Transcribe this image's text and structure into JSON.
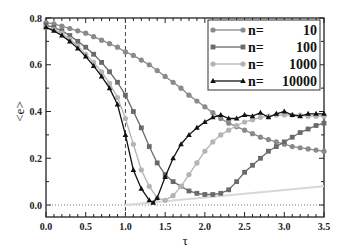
{
  "chart_data": {
    "type": "line",
    "title": "",
    "xlabel": "τ",
    "ylabel": "<e>",
    "xlim": [
      0.0,
      3.5
    ],
    "ylim": [
      0.0,
      0.8
    ],
    "xticks": [
      "0.0",
      "0.5",
      "1.0",
      "1.5",
      "2.0",
      "2.5",
      "3.0",
      "3.5"
    ],
    "yticks": [
      "0.0",
      "0.2",
      "0.4",
      "0.6",
      "0.8"
    ],
    "legend_position": "upper right",
    "annotations": [
      {
        "type": "vertical-dashed-line",
        "x": 1.0
      },
      {
        "type": "horizontal-dotted-line",
        "y": 0.0
      },
      {
        "type": "light-line",
        "x": [
          1.0,
          3.5
        ],
        "y": [
          0.0,
          0.08
        ]
      }
    ],
    "series": [
      {
        "name": "n=    10",
        "marker": "circle",
        "color": "#8a8a8a",
        "x": [
          0,
          0.1,
          0.2,
          0.3,
          0.4,
          0.5,
          0.6,
          0.7,
          0.8,
          0.9,
          1.0,
          1.1,
          1.2,
          1.3,
          1.4,
          1.5,
          1.6,
          1.7,
          1.8,
          1.9,
          2.0,
          2.1,
          2.2,
          2.3,
          2.4,
          2.5,
          2.6,
          2.7,
          2.8,
          2.9,
          3.0,
          3.1,
          3.2,
          3.3,
          3.4,
          3.5
        ],
        "y": [
          0.78,
          0.775,
          0.765,
          0.755,
          0.745,
          0.735,
          0.72,
          0.705,
          0.69,
          0.675,
          0.655,
          0.64,
          0.62,
          0.6,
          0.575,
          0.55,
          0.525,
          0.5,
          0.47,
          0.445,
          0.42,
          0.395,
          0.37,
          0.35,
          0.335,
          0.32,
          0.305,
          0.29,
          0.28,
          0.27,
          0.26,
          0.25,
          0.245,
          0.24,
          0.235,
          0.23
        ]
      },
      {
        "name": "n=   100",
        "marker": "square",
        "color": "#6a6a6a",
        "x": [
          0,
          0.1,
          0.2,
          0.3,
          0.4,
          0.5,
          0.6,
          0.7,
          0.8,
          0.9,
          1.0,
          1.1,
          1.2,
          1.3,
          1.4,
          1.5,
          1.6,
          1.7,
          1.8,
          1.9,
          2.0,
          2.1,
          2.2,
          2.3,
          2.4,
          2.5,
          2.6,
          2.7,
          2.8,
          2.9,
          3.0,
          3.1,
          3.2,
          3.3,
          3.4,
          3.5
        ],
        "y": [
          0.77,
          0.76,
          0.745,
          0.725,
          0.7,
          0.675,
          0.645,
          0.61,
          0.57,
          0.525,
          0.47,
          0.4,
          0.33,
          0.25,
          0.18,
          0.13,
          0.1,
          0.08,
          0.06,
          0.05,
          0.045,
          0.045,
          0.05,
          0.065,
          0.1,
          0.14,
          0.17,
          0.2,
          0.23,
          0.25,
          0.27,
          0.29,
          0.31,
          0.325,
          0.34,
          0.35
        ]
      },
      {
        "name": "n=  1000",
        "marker": "circle",
        "color": "#b4b4b4",
        "x": [
          0,
          0.1,
          0.2,
          0.3,
          0.4,
          0.5,
          0.6,
          0.7,
          0.8,
          0.9,
          1.0,
          1.1,
          1.2,
          1.3,
          1.4,
          1.5,
          1.6,
          1.7,
          1.8,
          1.9,
          2.0,
          2.1,
          2.2,
          2.3,
          2.4,
          2.5,
          2.6,
          2.7,
          2.8,
          2.9,
          3.0,
          3.1,
          3.2,
          3.3,
          3.4,
          3.5
        ],
        "y": [
          0.76,
          0.75,
          0.735,
          0.71,
          0.68,
          0.645,
          0.61,
          0.57,
          0.52,
          0.46,
          0.37,
          0.26,
          0.15,
          0.08,
          0.03,
          0.02,
          0.04,
          0.08,
          0.13,
          0.18,
          0.23,
          0.27,
          0.3,
          0.32,
          0.34,
          0.355,
          0.365,
          0.375,
          0.38,
          0.385,
          0.385,
          0.385,
          0.385,
          0.38,
          0.38,
          0.38
        ]
      },
      {
        "name": "n=10000",
        "marker": "triangle",
        "color": "#111111",
        "x": [
          0,
          0.1,
          0.2,
          0.3,
          0.4,
          0.5,
          0.6,
          0.7,
          0.8,
          0.9,
          1.0,
          1.1,
          1.2,
          1.3,
          1.35,
          1.4,
          1.5,
          1.6,
          1.7,
          1.8,
          1.9,
          2.0,
          2.1,
          2.2,
          2.3,
          2.4,
          2.5,
          2.6,
          2.7,
          2.8,
          2.9,
          3.0,
          3.1,
          3.2,
          3.3,
          3.4,
          3.5
        ],
        "y": [
          0.76,
          0.745,
          0.725,
          0.7,
          0.67,
          0.635,
          0.595,
          0.55,
          0.5,
          0.43,
          0.3,
          0.15,
          0.07,
          0.02,
          0.01,
          0.03,
          0.12,
          0.2,
          0.26,
          0.3,
          0.33,
          0.355,
          0.375,
          0.385,
          0.37,
          0.37,
          0.385,
          0.38,
          0.395,
          0.375,
          0.39,
          0.4,
          0.385,
          0.38,
          0.39,
          0.39,
          0.39
        ]
      }
    ]
  }
}
